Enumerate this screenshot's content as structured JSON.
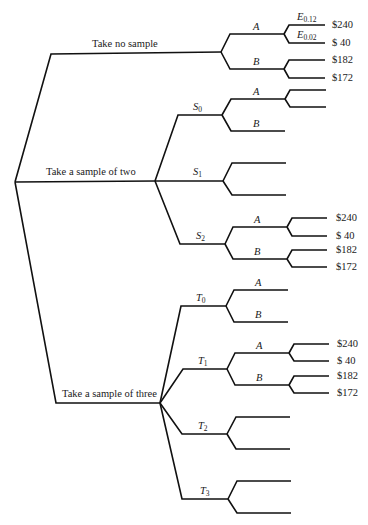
{
  "diagram": {
    "type": "decision-tree",
    "root_branches": [
      {
        "label": "Take no sample"
      },
      {
        "label": "Take a sample of two"
      },
      {
        "label": "Take a sample of three"
      }
    ],
    "sample_two_outcomes": [
      {
        "label": "S",
        "sub": "0"
      },
      {
        "label": "S",
        "sub": "1"
      },
      {
        "label": "S",
        "sub": "2"
      }
    ],
    "sample_three_outcomes": [
      {
        "label": "T",
        "sub": "0"
      },
      {
        "label": "T",
        "sub": "1"
      },
      {
        "label": "T",
        "sub": "2"
      },
      {
        "label": "T",
        "sub": "3"
      }
    ],
    "actions": {
      "a": "A",
      "b": "B"
    },
    "events": [
      {
        "label": "E",
        "sub": "0.12"
      },
      {
        "label": "E",
        "sub": "0.02"
      }
    ],
    "payoffs": {
      "a_high": "$240",
      "a_low": "$ 40",
      "b_high": "$182",
      "b_low": "$172"
    }
  }
}
